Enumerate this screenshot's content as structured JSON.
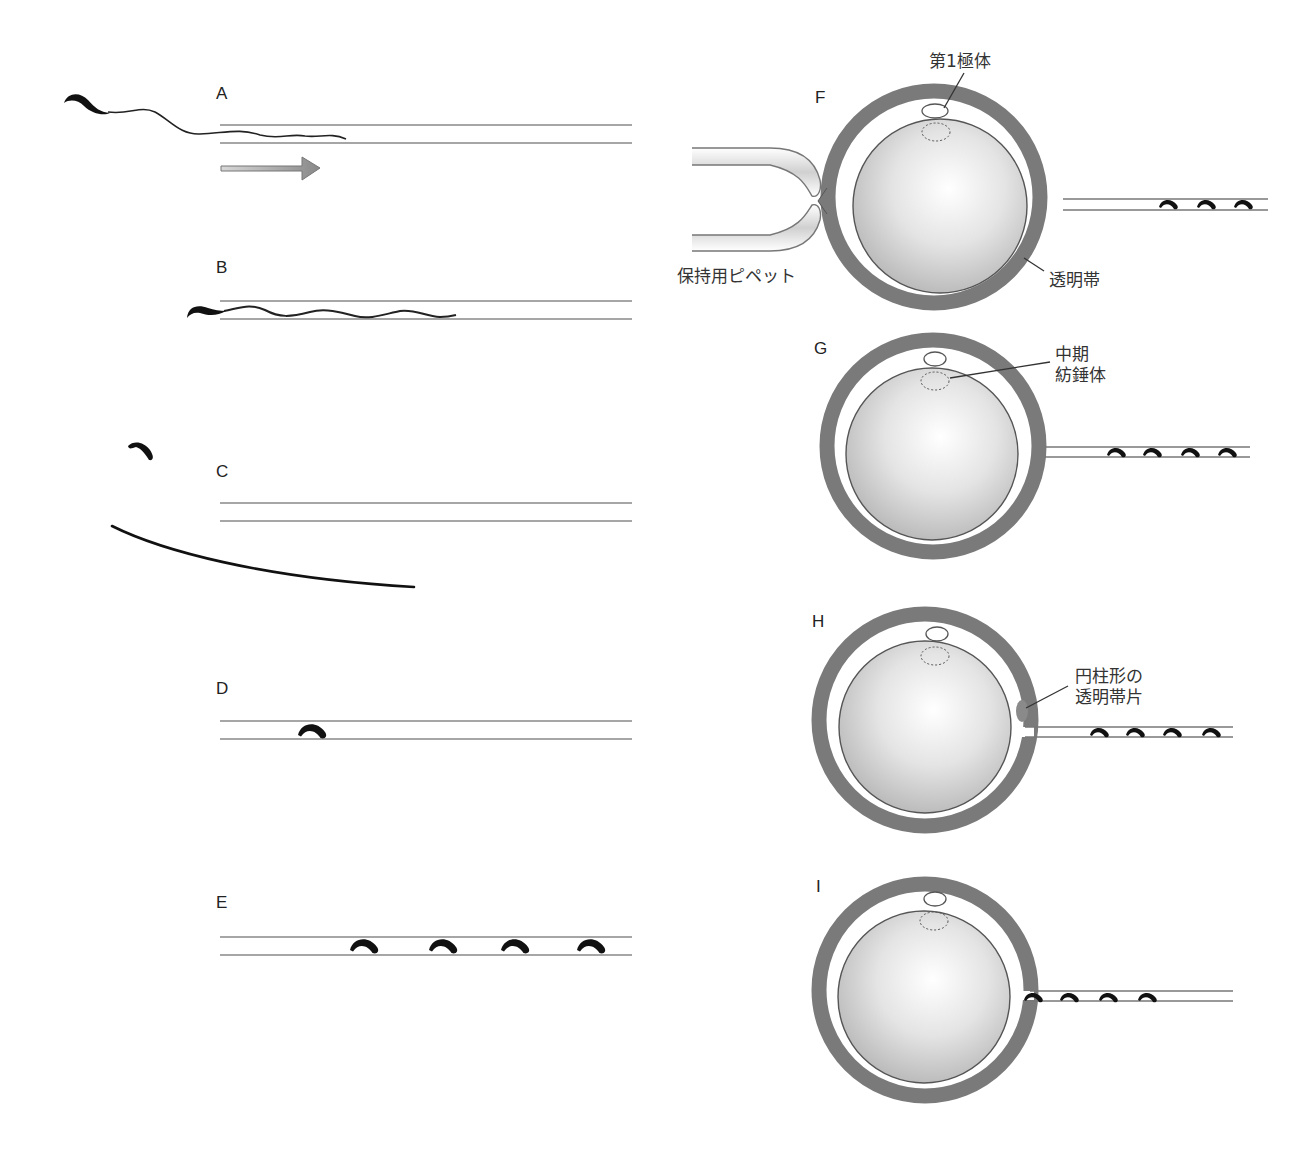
{
  "figure": {
    "panels": [
      {
        "id": "A",
        "label": "A"
      },
      {
        "id": "B",
        "label": "B"
      },
      {
        "id": "C",
        "label": "C"
      },
      {
        "id": "D",
        "label": "D"
      },
      {
        "id": "E",
        "label": "E"
      },
      {
        "id": "F",
        "label": "F"
      },
      {
        "id": "G",
        "label": "G"
      },
      {
        "id": "H",
        "label": "H"
      },
      {
        "id": "I",
        "label": "I"
      }
    ],
    "callouts": {
      "first_polar_body": "第1極体",
      "holding_pipette": "保持用ピペット",
      "zona_pellucida": "透明帯",
      "metaphase_spindle_line1": "中期",
      "metaphase_spindle_line2": "紡錘体",
      "zp_fragment_line1": "円柱形の",
      "zp_fragment_line2": "透明帯片"
    },
    "colors": {
      "zona": "#7a7a7a",
      "oocyte_light": "#f8f8f8",
      "oocyte_dark": "#b8b8b8",
      "pipette_line": "#777777",
      "sperm": "#111111",
      "arrow_fill": "#a0a0a0"
    }
  }
}
